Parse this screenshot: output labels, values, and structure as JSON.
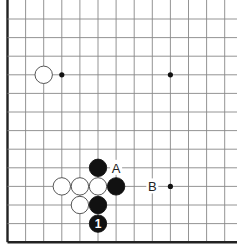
{
  "diagram": {
    "type": "go-board-fragment",
    "grid": {
      "columns": 13,
      "rows": 13,
      "left_edge_visible": true,
      "bottom_edge_visible": true,
      "line_color": "#888888",
      "edge_color": "#222222"
    },
    "star_points": [
      {
        "col": 3,
        "row": 3
      },
      {
        "col": 9,
        "row": 3
      },
      {
        "col": 9,
        "row": 9
      }
    ],
    "stones": [
      {
        "color": "white",
        "col": 2,
        "row": 3
      },
      {
        "color": "black",
        "col": 5,
        "row": 8
      },
      {
        "color": "white",
        "col": 3,
        "row": 9
      },
      {
        "color": "white",
        "col": 4,
        "row": 9
      },
      {
        "color": "white",
        "col": 5,
        "row": 9
      },
      {
        "color": "black",
        "col": 6,
        "row": 9
      },
      {
        "color": "white",
        "col": 4,
        "row": 10
      },
      {
        "color": "black",
        "col": 5,
        "row": 10
      },
      {
        "color": "black",
        "col": 5,
        "row": 11,
        "label": "1"
      }
    ],
    "markers": [
      {
        "label": "A",
        "col": 6,
        "row": 8
      },
      {
        "label": "B",
        "col": 8,
        "row": 9
      }
    ]
  }
}
